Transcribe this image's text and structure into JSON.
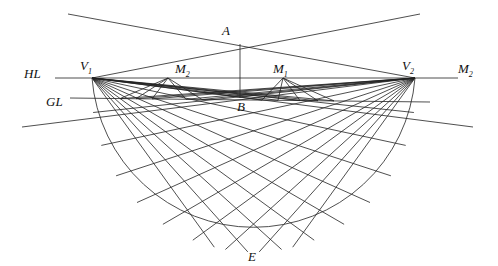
{
  "diagram": {
    "title": "",
    "labels": {
      "A": "A",
      "B": "B",
      "E": "E",
      "HL": "HL",
      "GL": "GL",
      "V1": "V",
      "V1_sub": "1",
      "V2": "V",
      "V2_sub": "2",
      "M1": "M",
      "M1_sub": "1",
      "M2_left": "M",
      "M2_left_sub": "2",
      "M2_right": "M",
      "M2_right_sub": "2"
    },
    "grid": {
      "description": "Two-point perspective construction: lines fan from vanishing points V1 and V2 and measuring points M1, M2 onto a semicircular plan below the ground line",
      "rays_per_vanishing_point": 9,
      "rays_per_measuring_point": 5
    }
  }
}
